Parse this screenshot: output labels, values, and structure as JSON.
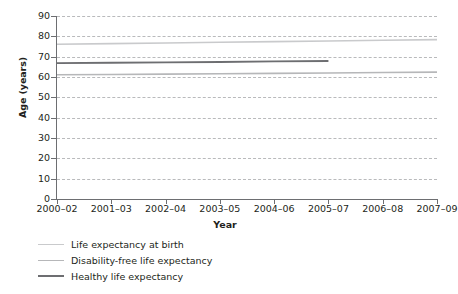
{
  "chart_data": {
    "type": "line",
    "title": "",
    "xlabel": "Year",
    "ylabel": "Age (years)",
    "ylim": [
      0,
      90
    ],
    "yticks": [
      0,
      10,
      20,
      30,
      40,
      50,
      60,
      70,
      80,
      90
    ],
    "ytick_labels": [
      "0",
      "10",
      "20",
      "30",
      "40",
      "50",
      "60",
      "70",
      "80",
      "90"
    ],
    "categories": [
      "2000–02",
      "2001–03",
      "2002–04",
      "2003–05",
      "2004–06",
      "2005–07",
      "2006–08",
      "2007–09"
    ],
    "grid": "horizontal-dashed",
    "legend_position": "below-left",
    "series": [
      {
        "name": "Life expectancy at birth",
        "color": "#c9cacc",
        "values": [
          76.1,
          76.4,
          76.7,
          77.1,
          77.4,
          77.7,
          78.1,
          78.4
        ]
      },
      {
        "name": "Disability-free life expectancy",
        "color": "#b6b7b9",
        "values": [
          61.1,
          61.2,
          61.4,
          61.6,
          61.8,
          62.0,
          62.2,
          62.4
        ]
      },
      {
        "name": "Healthy life expectancy",
        "color": "#6d6e71",
        "values": [
          66.8,
          67.0,
          67.2,
          67.4,
          67.7,
          67.9,
          null,
          null
        ]
      }
    ]
  },
  "axes": {
    "y_title": "Age (years)",
    "x_title": "Year"
  },
  "legend": {
    "items": [
      {
        "label": "Life expectancy at birth",
        "color": "#c9cacc"
      },
      {
        "label": "Disability-free life expectancy",
        "color": "#b6b7b9"
      },
      {
        "label": "Healthy life expectancy",
        "color": "#6d6e71"
      }
    ]
  },
  "colors": {
    "axis": "#6d6e71",
    "grid": "#b9babc",
    "text": "#231f20",
    "background": "#ffffff"
  }
}
